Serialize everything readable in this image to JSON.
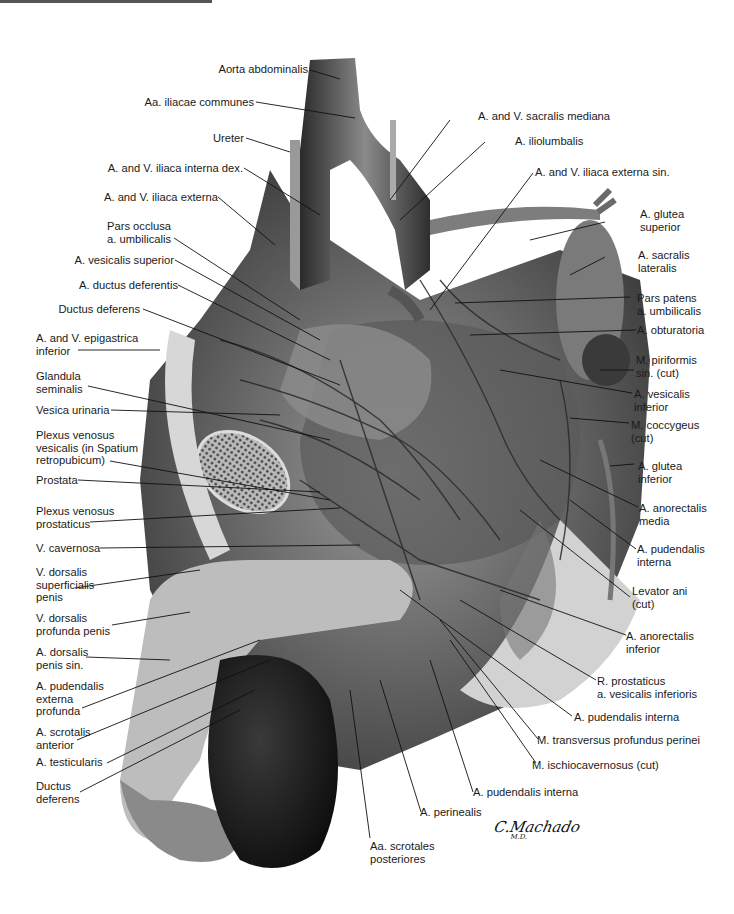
{
  "figure": {
    "signature": "C.Machado",
    "signature_suffix": "M.D."
  },
  "labels_left": [
    {
      "id": "aorta",
      "text": "Aorta abdominalis"
    },
    {
      "id": "iliacae-communes",
      "text": "Aa. iliacae communes"
    },
    {
      "id": "ureter",
      "text": "Ureter"
    },
    {
      "id": "iliaca-interna-dex",
      "text": "A. and V. iliaca interna dex."
    },
    {
      "id": "iliaca-externa",
      "text": "A. and V. iliaca externa"
    },
    {
      "id": "pars-occlusa",
      "text": "Pars occlusa\na. umbilicalis"
    },
    {
      "id": "vesicalis-superior",
      "text": "A. vesicalis superior"
    },
    {
      "id": "ductus-deferentis",
      "text": "A. ductus deferentis"
    },
    {
      "id": "ductus-deferens",
      "text": "Ductus deferens"
    },
    {
      "id": "epigastrica-inferior",
      "text": "A. and V. epigastrica\ninferior"
    },
    {
      "id": "glandula-seminalis",
      "text": "Glandula\nseminalis"
    },
    {
      "id": "vesica-urinaria",
      "text": "Vesica urinaria"
    },
    {
      "id": "plexus-venosus-vesicalis",
      "text": "Plexus venosus\nvesicalis (in Spatium\nretropubicum)"
    },
    {
      "id": "prostata",
      "text": "Prostata"
    },
    {
      "id": "plexus-venosus-prostaticus",
      "text": "Plexus venosus\nprostaticus"
    },
    {
      "id": "v-cavernosa",
      "text": "V. cavernosa"
    },
    {
      "id": "v-dorsalis-superficialis",
      "text": "V. dorsalis\nsuperficialis\npenis"
    },
    {
      "id": "v-dorsalis-profunda",
      "text": "V. dorsalis\nprofunda penis"
    },
    {
      "id": "a-dorsalis-penis",
      "text": "A. dorsalis\npenis sin."
    },
    {
      "id": "pudendalis-externa-profunda",
      "text": "A. pudendalis\nexterna\nprofunda"
    },
    {
      "id": "scrotalis-anterior",
      "text": "A. scrotalis\nanterior"
    },
    {
      "id": "testicularis",
      "text": "A. testicularis"
    },
    {
      "id": "ductus-deferens-2",
      "text": "Ductus\ndeferens"
    }
  ],
  "labels_right": [
    {
      "id": "sacralis-mediana",
      "text": "A. and V. sacralis mediana"
    },
    {
      "id": "iliolumbalis",
      "text": "A. iliolumbalis"
    },
    {
      "id": "iliaca-externa-sin",
      "text": "A. and V. iliaca externa sin."
    },
    {
      "id": "glutea-superior",
      "text": "A. glutea\nsuperior"
    },
    {
      "id": "sacralis-lateralis",
      "text": "A. sacralis\nlateralis"
    },
    {
      "id": "pars-patens",
      "text": "Pars patens\na. umbilicalis"
    },
    {
      "id": "obturatoria",
      "text": "A. obturatoria"
    },
    {
      "id": "piriformis",
      "text": "M. piriformis\nsin. (cut)"
    },
    {
      "id": "vesicalis-inferior",
      "text": "A. vesicalis\ninferior"
    },
    {
      "id": "coccygeus",
      "text": "M. coccygeus\n(cut)"
    },
    {
      "id": "glutea-inferior",
      "text": "A. glutea\ninferior"
    },
    {
      "id": "anorectalis-media",
      "text": "A. anorectalis\nmedia"
    },
    {
      "id": "pudendalis-interna-1",
      "text": "A. pudendalis\ninterna"
    },
    {
      "id": "levator-ani",
      "text": "Levator ani\n(cut)"
    },
    {
      "id": "anorectalis-inferior",
      "text": "A. anorectalis\ninferior"
    },
    {
      "id": "r-prostaticus",
      "text": "R. prostaticus\na. vesicalis inferioris"
    },
    {
      "id": "pudendalis-interna-2",
      "text": "A. pudendalis interna"
    },
    {
      "id": "transversus-profundus",
      "text": "M. transversus profundus perinei"
    },
    {
      "id": "ischiocavernosus",
      "text": "M. ischiocavernosus (cut)"
    },
    {
      "id": "pudendalis-interna-3",
      "text": "A. pudendalis interna"
    },
    {
      "id": "perinealis",
      "text": "A. perinealis"
    },
    {
      "id": "scrotales-posteriores",
      "text": "Aa. scrotales\nposteriores"
    }
  ]
}
